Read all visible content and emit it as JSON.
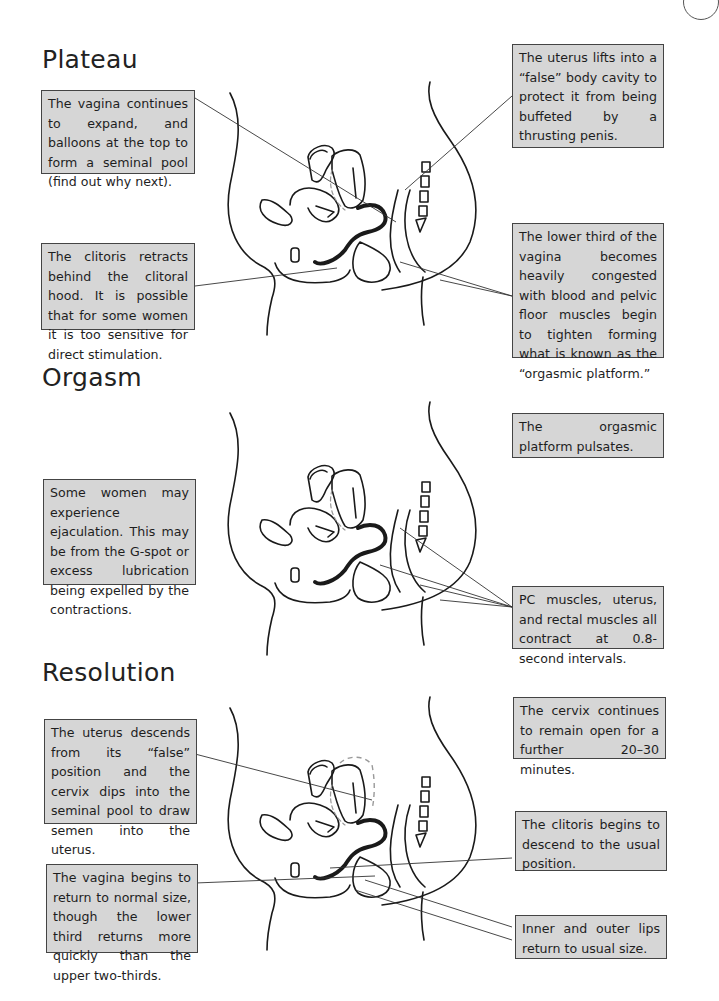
{
  "page": {
    "colors": {
      "box_fill": "#d6d6d6",
      "box_border": "#444444",
      "ink": "#1a1a1a",
      "dash": "#999999"
    }
  },
  "sections": [
    {
      "title": "Plateau",
      "callouts": [
        "The vagina continues to expand, and balloons at the top to form a seminal pool (find out why next).",
        "The clitoris retracts behind the clitoral hood. It is possible that for some women it is too sensitive for direct stimulation.",
        "The uterus lifts into a “false” body cavity to protect it from being buffeted by a thrusting penis.",
        "The lower third of the vagina becomes heavily congested with blood and pelvic floor muscles begin to tighten forming what is known as the “orgasmic platform.”"
      ]
    },
    {
      "title": "Orgasm",
      "callouts": [
        "Some women may experience ejaculation. This may be from the G-spot or excess lubrication being expelled by the contractions.",
        "The orgasmic platform pulsates.",
        "PC muscles, uterus, and rectal muscles all contract at 0.8-second intervals."
      ]
    },
    {
      "title": "Resolution",
      "callouts": [
        "The uterus descends from its “false” position and the cervix dips into the seminal pool to draw semen into the uterus.",
        "The vagina begins to return to normal size, though the lower third returns more quickly than the upper two-thirds.",
        "The cervix continues to remain open for a further 20–30 minutes.",
        "The clitoris begins to descend to the usual position.",
        "Inner and outer lips return to usual size."
      ]
    }
  ]
}
